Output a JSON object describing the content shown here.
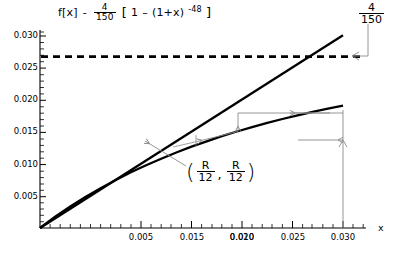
{
  "chart_data": {
    "type": "line",
    "title_parts": {
      "fx": "f[x]",
      "dash": "-",
      "coef_num": "4",
      "coef_den": "150",
      "bracket_open": "[",
      "one": "1",
      "minus": "–",
      "base": "(1+x)",
      "exponent": "-48",
      "bracket_close": "]"
    },
    "corner_label": {
      "num": "4",
      "den": "150"
    },
    "xlabel": "x",
    "ylabel": "",
    "xlim": [
      0,
      0.0315
    ],
    "ylim": [
      0,
      0.0315
    ],
    "grid": false,
    "legend": "none",
    "xticks": [
      0.005,
      0.01,
      0.015,
      0.02,
      0.025,
      0.03
    ],
    "xticklabels": [
      "0.005",
      "0.010",
      "0.015",
      "0.020",
      "0.025",
      "0.030"
    ],
    "yticks": [
      0.005,
      0.01,
      0.015,
      0.02,
      0.025,
      0.03
    ],
    "yticklabels": [
      "0.005",
      "0.010",
      "0.015",
      "0.020",
      "0.025",
      "0.030"
    ],
    "series": [
      {
        "name": "y = x (straight line)",
        "style": "solid",
        "x": [
          0,
          0.003,
          0.006,
          0.009,
          0.012,
          0.015,
          0.018,
          0.021,
          0.024,
          0.027,
          0.03
        ],
        "values": [
          0,
          0.003,
          0.006,
          0.009,
          0.012,
          0.015,
          0.018,
          0.021,
          0.024,
          0.027,
          0.03
        ]
      },
      {
        "name": "f[x] = (4/150)[1 - (1+x)^-48]",
        "style": "solid",
        "x": [
          0,
          0.0015,
          0.003,
          0.0045,
          0.006,
          0.0075,
          0.009,
          0.0105,
          0.012,
          0.0135,
          0.015,
          0.0165,
          0.018,
          0.0195,
          0.021,
          0.0225,
          0.024,
          0.0255,
          0.027,
          0.0285,
          0.03
        ],
        "values": [
          0,
          0.00174,
          0.00334,
          0.00482,
          0.0062,
          0.00747,
          0.00866,
          0.00976,
          0.01079,
          0.01175,
          0.01265,
          0.01349,
          0.01428,
          0.01501,
          0.0157,
          0.01635,
          0.01696,
          0.01753,
          0.01806,
          0.01857,
          0.01904
        ]
      },
      {
        "name": "asymptote 4/150",
        "style": "dashed",
        "x": [
          0,
          0.03
        ],
        "values": [
          0.026667,
          0.026667
        ]
      }
    ],
    "annotations": [
      {
        "name": "intersection-point",
        "text": "(R/12 , R/12)",
        "num1": "R",
        "den1": "12",
        "num2": "R",
        "den2": "12",
        "at_x": 0.0102,
        "at_y": 0.0102
      }
    ]
  }
}
